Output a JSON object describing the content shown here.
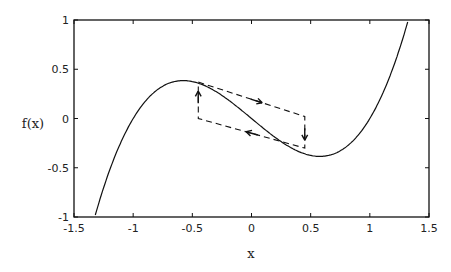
{
  "chart_data": {
    "type": "line",
    "title": "",
    "xlabel": "x",
    "ylabel": "f(x)",
    "xlim": [
      -1.5,
      1.5
    ],
    "ylim": [
      -1,
      1
    ],
    "xticks": [
      -1.5,
      -1,
      -0.5,
      0,
      0.5,
      1,
      1.5
    ],
    "xtick_labels": [
      "-1.5",
      "-1",
      "-0.5",
      "0",
      "0.5",
      "1",
      "1.5"
    ],
    "yticks": [
      1,
      0.5,
      0,
      -0.5,
      -1
    ],
    "ytick_labels": [
      "1",
      "0.5",
      "0",
      "-0.5",
      "-1"
    ],
    "grid": false,
    "legend": null,
    "series": [
      {
        "name": "f(x) = x^3 - x",
        "style": "solid",
        "x": [
          -1.32,
          -1.2,
          -1.1,
          -1.0,
          -0.9,
          -0.8,
          -0.7,
          -0.6,
          -0.5,
          -0.4,
          -0.3,
          -0.2,
          -0.1,
          0,
          0.1,
          0.2,
          0.3,
          0.4,
          0.5,
          0.6,
          0.7,
          0.8,
          0.9,
          1.0,
          1.1,
          1.2,
          1.32
        ],
        "values": [
          -0.98,
          -0.53,
          -0.23,
          0.0,
          0.17,
          0.29,
          0.36,
          0.38,
          0.38,
          0.34,
          0.27,
          0.19,
          0.1,
          0.0,
          -0.1,
          -0.19,
          -0.27,
          -0.34,
          -0.38,
          -0.38,
          -0.36,
          -0.29,
          -0.17,
          0.0,
          0.23,
          0.53,
          0.98
        ]
      },
      {
        "name": "hysteresis loop",
        "style": "dashed",
        "x": [
          -0.45,
          0.45,
          0.45,
          -0.45,
          -0.45
        ],
        "values": [
          0.37,
          0.02,
          -0.3,
          0.0,
          0.37
        ]
      }
    ],
    "annotations": [
      {
        "type": "arrow",
        "direction": "right-down",
        "at": [
          0.05,
          0.2
        ],
        "on": "top dashed edge"
      },
      {
        "type": "arrow",
        "direction": "down",
        "at": [
          0.45,
          -0.2
        ],
        "on": "right vertical edge"
      },
      {
        "type": "arrow",
        "direction": "left-up",
        "at": [
          -0.1,
          -0.15
        ],
        "on": "bottom dashed edge"
      },
      {
        "type": "arrow",
        "direction": "up",
        "at": [
          -0.45,
          0.25
        ],
        "on": "left vertical edge"
      }
    ]
  }
}
